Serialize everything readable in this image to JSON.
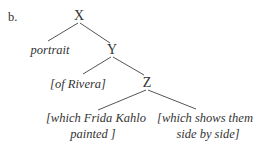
{
  "item_label": "b.",
  "nodes": {
    "x": "X",
    "y": "Y",
    "z": "Z"
  },
  "leaves": {
    "portrait": "portrait",
    "of_rivera": "[of Rivera]",
    "frida_line1": "[which Frida Kahlo",
    "frida_line2": "painted ]",
    "shows_line1": "[which shows them",
    "shows_line2": "side by side]"
  },
  "colors": {
    "text": "#333333",
    "edge": "#555555"
  }
}
